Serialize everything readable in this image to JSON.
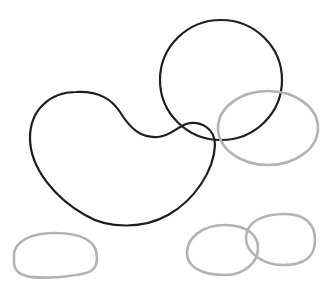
{
  "diagram": {
    "type": "closed-curve-sketch",
    "colors": {
      "background": "#ffffff",
      "dark_stroke": "#1e1e1e",
      "light_stroke": "#b3b3b3"
    },
    "shapes": [
      {
        "name": "kidney-shape",
        "stroke": "dark",
        "description": "large bean/kidney shaped closed curve"
      },
      {
        "name": "large-circle",
        "stroke": "dark",
        "center": [
          221,
          80
        ],
        "radius": 61
      },
      {
        "name": "right-ellipse",
        "stroke": "light",
        "center": [
          268,
          128
        ],
        "rx": 50,
        "ry": 38
      },
      {
        "name": "bottom-left-oval",
        "stroke": "light",
        "center": [
          55,
          257
        ]
      },
      {
        "name": "bottom-middle-oval",
        "stroke": "light",
        "center": [
          222,
          249
        ]
      },
      {
        "name": "bottom-right-oval",
        "stroke": "light",
        "center": [
          281,
          239
        ]
      }
    ]
  }
}
